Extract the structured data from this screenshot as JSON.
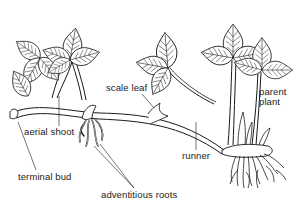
{
  "diagram": {
    "colors": {
      "ink": "#1a1a1a",
      "leaf_fill": "#ffffff",
      "background": "#ffffff"
    },
    "labels": {
      "scale_leaf": "scale leaf",
      "parent_plant_line1": "parent",
      "parent_plant_line2": "plant",
      "aerial_shoot": "aerial shoot",
      "runner": "runner",
      "terminal_bud": "terminal bud",
      "adventitious_roots": "adventitious roots"
    },
    "parts": [
      "left daughter plant with leaves",
      "middle trifoliate leaf",
      "parent plant with leaves",
      "runner stem",
      "scale leaf node",
      "adventitious roots at node",
      "parent plant root mass",
      "terminal bud"
    ]
  }
}
